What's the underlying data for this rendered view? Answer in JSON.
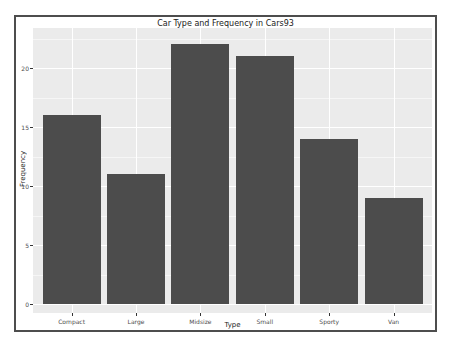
{
  "figure": {
    "title": "Car Type and Frequency in Cars93",
    "xlabel": "Type",
    "ylabel": "Frequency"
  },
  "chart_data": {
    "type": "bar",
    "title": "Car Type and Frequency in Cars93",
    "xlabel": "Type",
    "ylabel": "Frequency",
    "categories": [
      "Compact",
      "Large",
      "Midsize",
      "Small",
      "Sporty",
      "Van"
    ],
    "values": [
      16,
      11,
      22,
      21,
      14,
      9
    ],
    "ylim": [
      0,
      23.4
    ],
    "yticks": [
      0,
      5,
      10,
      15,
      20
    ],
    "yticks_minor": [
      2.5,
      7.5,
      12.5,
      17.5,
      22.5
    ],
    "grid": "on",
    "legend": "none",
    "colors": {
      "bar_fill": "#4c4c4c",
      "panel_background": "#ebebeb",
      "gridline_major": "#ffffff",
      "tick_label": "#4d4d4d",
      "title_text": "#1a1a1a",
      "frame_border": "#4d4d4d",
      "page_background": "#ffffff"
    }
  }
}
